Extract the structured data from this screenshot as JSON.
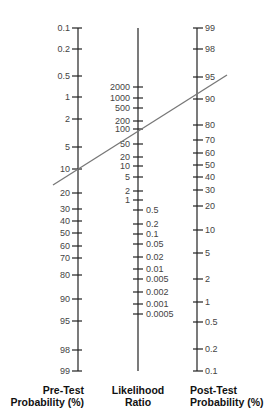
{
  "chart_data": {
    "type": "nomogram",
    "title": "",
    "axes": [
      {
        "name": "Pre-Test Probability (%)",
        "label_lines": [
          "Pre-Test",
          "Probability (%)"
        ],
        "x": 78,
        "label_side": "left",
        "top": 28,
        "bottom": 371,
        "ticks": [
          {
            "label": "0.1",
            "y": 28
          },
          {
            "label": "0.2",
            "y": 49
          },
          {
            "label": "0.5",
            "y": 76
          },
          {
            "label": "1",
            "y": 97
          },
          {
            "label": "2",
            "y": 119
          },
          {
            "label": "5",
            "y": 147
          },
          {
            "label": "10",
            "y": 169
          },
          {
            "label": "20",
            "y": 193
          },
          {
            "label": "30",
            "y": 209
          },
          {
            "label": "40",
            "y": 221
          },
          {
            "label": "50",
            "y": 233
          },
          {
            "label": "60",
            "y": 246
          },
          {
            "label": "70",
            "y": 258
          },
          {
            "label": "80",
            "y": 275
          },
          {
            "label": "90",
            "y": 299
          },
          {
            "label": "95",
            "y": 321
          },
          {
            "label": "98",
            "y": 350
          },
          {
            "label": "99",
            "y": 371
          }
        ]
      },
      {
        "name": "Likelihood Ratio",
        "label_lines": [
          "Likelihood",
          "Ratio"
        ],
        "x": 138,
        "label_side": "mixed",
        "top": 28,
        "bottom": 371,
        "ticks": [
          {
            "label": "2000",
            "y": 87,
            "side": "left"
          },
          {
            "label": "1000",
            "y": 98,
            "side": "left"
          },
          {
            "label": "500",
            "y": 108,
            "side": "left"
          },
          {
            "label": "200",
            "y": 121,
            "side": "left"
          },
          {
            "label": "100",
            "y": 129,
            "side": "left"
          },
          {
            "label": "50",
            "y": 144,
            "side": "left"
          },
          {
            "label": "20",
            "y": 157,
            "side": "left"
          },
          {
            "label": "10",
            "y": 166,
            "side": "left"
          },
          {
            "label": "5",
            "y": 177,
            "side": "left"
          },
          {
            "label": "2",
            "y": 191,
            "side": "left"
          },
          {
            "label": "1",
            "y": 200,
            "side": "left"
          },
          {
            "label": "0.5",
            "y": 210,
            "side": "right"
          },
          {
            "label": "0.2",
            "y": 224,
            "side": "right"
          },
          {
            "label": "0.1",
            "y": 234,
            "side": "right"
          },
          {
            "label": "0.05",
            "y": 244,
            "side": "right"
          },
          {
            "label": "0.02",
            "y": 257,
            "side": "right"
          },
          {
            "label": "0.01",
            "y": 269,
            "side": "right"
          },
          {
            "label": "0.005",
            "y": 279,
            "side": "right"
          },
          {
            "label": "0.002",
            "y": 292,
            "side": "right"
          },
          {
            "label": "0.001",
            "y": 304,
            "side": "right"
          },
          {
            "label": "0.0005",
            "y": 314,
            "side": "right"
          }
        ]
      },
      {
        "name": "Post-Test Probability (%)",
        "label_lines": [
          "Post-Test",
          "Probability (%)"
        ],
        "x": 197,
        "label_side": "right",
        "top": 28,
        "bottom": 371,
        "ticks": [
          {
            "label": "99",
            "y": 28
          },
          {
            "label": "98",
            "y": 49
          },
          {
            "label": "95",
            "y": 77
          },
          {
            "label": "90",
            "y": 99
          },
          {
            "label": "80",
            "y": 125
          },
          {
            "label": "70",
            "y": 140
          },
          {
            "label": "60",
            "y": 153
          },
          {
            "label": "50",
            "y": 165
          },
          {
            "label": "40",
            "y": 177
          },
          {
            "label": "30",
            "y": 190
          },
          {
            "label": "20",
            "y": 206
          },
          {
            "label": "10",
            "y": 230
          },
          {
            "label": "5",
            "y": 253
          },
          {
            "label": "2",
            "y": 279
          },
          {
            "label": "1",
            "y": 302
          },
          {
            "label": "0.5",
            "y": 322
          },
          {
            "label": "0.2",
            "y": 349
          },
          {
            "label": "0.1",
            "y": 371
          }
        ]
      }
    ],
    "example_line": {
      "pre_test_probability": 10,
      "likelihood_ratio": 100,
      "post_test_probability": 92,
      "x1": 53,
      "y1": 185,
      "x2": 227,
      "y2": 75,
      "color": "#777777"
    },
    "colors": {
      "axis": "#222222",
      "text": "#444444",
      "line": "#777777"
    }
  },
  "labels": {
    "pre_line1": "Pre-Test",
    "pre_line2": "Probability (%)",
    "lr_line1": "Likelihood",
    "lr_line2": "Ratio",
    "post_line1": "Post-Test",
    "post_line2": "Probability (%)"
  }
}
